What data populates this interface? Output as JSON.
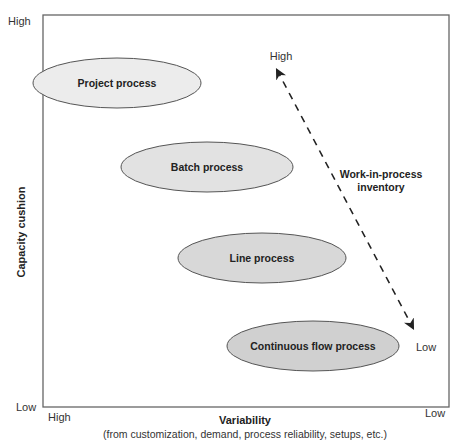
{
  "diagram": {
    "y_axis": {
      "title": "Capacity cushion",
      "high_label": "High",
      "low_label": "Low"
    },
    "x_axis": {
      "title": "Variability",
      "subtitle": "(from customization, demand, process reliability, setups, etc.)",
      "high_label": "High",
      "low_label": "Low"
    },
    "processes": [
      {
        "label": "Project process",
        "cx": 117,
        "cy": 83,
        "rx": 84,
        "ry": 25,
        "fill": "#ececec"
      },
      {
        "label": "Batch process",
        "cx": 207,
        "cy": 167,
        "rx": 86,
        "ry": 25,
        "fill": "#e2e2e2"
      },
      {
        "label": "Line process",
        "cx": 262,
        "cy": 258,
        "rx": 84,
        "ry": 25,
        "fill": "#d8d8d8"
      },
      {
        "label": "Continuous flow process",
        "cx": 313,
        "cy": 346,
        "rx": 86,
        "ry": 25,
        "fill": "#d0d0d0"
      }
    ],
    "wip_arrow": {
      "label_line1": "Work-in-process",
      "label_line2": "inventory",
      "high_label": "High",
      "low_label": "Low"
    },
    "colors": {
      "frame": "#666666",
      "ellipse_stroke": "#555555",
      "arrow": "#222222"
    }
  }
}
